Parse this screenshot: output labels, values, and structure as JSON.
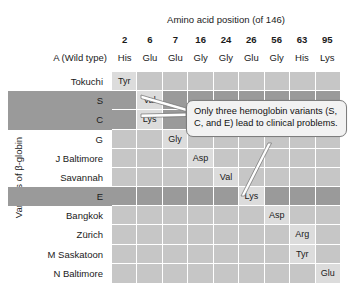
{
  "figure": {
    "top_axis_title": "Amino acid position (of 146)",
    "left_axis_title": "Variants of β-globin",
    "wildtype_row_label": "A (Wild type)"
  },
  "chart_data": {
    "type": "table",
    "title": "Amino acid position (of 146)",
    "xlabel": "Amino acid position (of 146)",
    "ylabel": "Variants of β-globin",
    "categories": [
      "2",
      "6",
      "7",
      "16",
      "24",
      "26",
      "56",
      "63",
      "95"
    ],
    "wild_type": {
      "label": "A (Wild type)",
      "values": [
        "His",
        "Glu",
        "Glu",
        "Gly",
        "Gly",
        "Glu",
        "Gly",
        "His",
        "Lys"
      ]
    },
    "rows": [
      {
        "label": "Tokuchi",
        "highlight": false,
        "cells": [
          "Tyr",
          "",
          "",
          "",
          "",
          "",
          "",
          "",
          ""
        ]
      },
      {
        "label": "S",
        "highlight": true,
        "cells": [
          "",
          "Val",
          "",
          "",
          "",
          "",
          "",
          "",
          ""
        ]
      },
      {
        "label": "C",
        "highlight": true,
        "cells": [
          "",
          "Lys",
          "",
          "",
          "",
          "",
          "",
          "",
          ""
        ]
      },
      {
        "label": "G",
        "highlight": false,
        "cells": [
          "",
          "",
          "Gly",
          "",
          "",
          "",
          "",
          "",
          ""
        ]
      },
      {
        "label": "J Baltimore",
        "highlight": false,
        "cells": [
          "",
          "",
          "",
          "Asp",
          "",
          "",
          "",
          "",
          ""
        ]
      },
      {
        "label": "Savannah",
        "highlight": false,
        "cells": [
          "",
          "",
          "",
          "",
          "Val",
          "",
          "",
          "",
          ""
        ]
      },
      {
        "label": "E",
        "highlight": true,
        "cells": [
          "",
          "",
          "",
          "",
          "",
          "Lys",
          "",
          "",
          ""
        ]
      },
      {
        "label": "Bangkok",
        "highlight": false,
        "cells": [
          "",
          "",
          "",
          "",
          "",
          "",
          "Asp",
          "",
          ""
        ]
      },
      {
        "label": "Zürich",
        "highlight": false,
        "cells": [
          "",
          "",
          "",
          "",
          "",
          "",
          "",
          "Arg",
          ""
        ]
      },
      {
        "label": "M Saskatoon",
        "highlight": false,
        "cells": [
          "",
          "",
          "",
          "",
          "",
          "",
          "",
          "Tyr",
          ""
        ]
      },
      {
        "label": "N Baltimore",
        "highlight": false,
        "cells": [
          "",
          "",
          "",
          "",
          "",
          "",
          "",
          "",
          "Glu"
        ]
      }
    ],
    "colors": {
      "cell_light": "#c6c6c6",
      "cell_highlight_row": "#9a9a9a",
      "cell_filled": "#dcdcdc",
      "background": "#ffffff",
      "text": "#1a1a1a",
      "callout_background": "#f2f2f2",
      "callout_border": "#7d7d7d"
    },
    "grid": true,
    "legend": "none"
  },
  "callout": {
    "text": "Only three hemoglobin variants (S, C, and E) lead to clinical problems."
  }
}
